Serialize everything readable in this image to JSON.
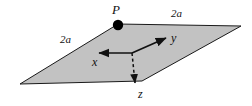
{
  "figure": {
    "type": "geometry-diagram",
    "background_color": "#ffffff",
    "plate": {
      "name": "square-plate",
      "fill_color": "#c2c2c2",
      "stroke_color": "#1a1a1a",
      "stroke_width": 1,
      "vertices": [
        {
          "x": 20,
          "y": 84
        },
        {
          "x": 118,
          "y": 24
        },
        {
          "x": 241,
          "y": 26
        },
        {
          "x": 142,
          "y": 81
        }
      ]
    },
    "point": {
      "label": "P",
      "marker": "filled-circle",
      "marker_color": "#000000",
      "marker_radius": 5,
      "position": {
        "x": 118,
        "y": 25
      }
    },
    "edge_labels": [
      {
        "text": "2a",
        "number": "2",
        "symbol": "a",
        "edge": "upper-left"
      },
      {
        "text": "2a",
        "number": "2",
        "symbol": "a",
        "edge": "upper-right"
      }
    ],
    "axes": {
      "origin": {
        "x": 132,
        "y": 53
      },
      "stroke_color": "#111111",
      "stroke_width": 1.6,
      "items": [
        {
          "label": "y",
          "direction": "up-right",
          "style": "solid",
          "arrowhead": true,
          "tip": {
            "x": 168,
            "y": 37
          }
        },
        {
          "label": "x",
          "direction": "left",
          "style": "solid",
          "arrowhead": true,
          "tip": {
            "x": 95,
            "y": 53
          }
        },
        {
          "label": "z",
          "direction": "down",
          "style": "dashed",
          "arrowhead": true,
          "tip": {
            "x": 136,
            "y": 86
          }
        }
      ]
    }
  }
}
